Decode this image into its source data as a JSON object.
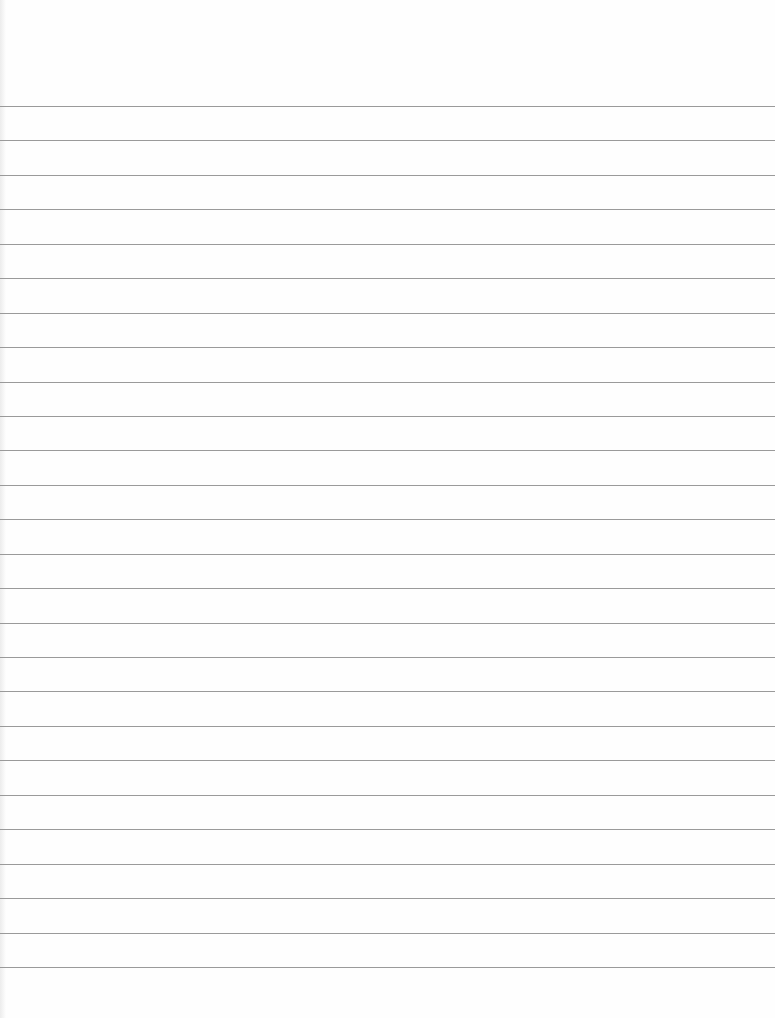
{
  "document": {
    "type": "lined-paper",
    "background_color": "#fefefe",
    "rule_color": "#9a9a9a",
    "rules": {
      "count": 26,
      "first_y": 106,
      "spacing": 34.44
    },
    "visible_text": []
  }
}
